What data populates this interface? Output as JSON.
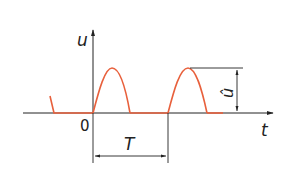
{
  "diagram": {
    "type": "half-wave rectified sine waveform",
    "axes": {
      "y_label": "u",
      "x_label": "t",
      "origin_label": "0"
    },
    "dimensions": {
      "period_label": "T",
      "amplitude_label": "û"
    },
    "colors": {
      "signal": "#e8603c",
      "axes": "#222222",
      "background": "#ffffff"
    }
  }
}
